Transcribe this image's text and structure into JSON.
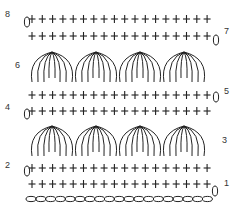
{
  "diagram": {
    "type": "crochet-chart",
    "stroke_color": "#222222",
    "stitches_per_row": 18,
    "foundation_chains": 19,
    "shells_per_row": 4,
    "row_labels": [
      {
        "row": "1",
        "side": "right"
      },
      {
        "row": "2",
        "side": "left"
      },
      {
        "row": "3",
        "side": "right"
      },
      {
        "row": "4",
        "side": "left"
      },
      {
        "row": "5",
        "side": "right"
      },
      {
        "row": "6",
        "side": "left"
      },
      {
        "row": "7",
        "side": "right"
      },
      {
        "row": "8",
        "side": "left"
      }
    ],
    "rows": [
      {
        "row": 1,
        "stitch": "single-crochet",
        "symbol": "+"
      },
      {
        "row": 2,
        "stitch": "single-crochet",
        "symbol": "+"
      },
      {
        "row": 3,
        "stitch": "shell",
        "symbol": "fan"
      },
      {
        "row": 4,
        "stitch": "single-crochet",
        "symbol": "+"
      },
      {
        "row": 5,
        "stitch": "single-crochet",
        "symbol": "+"
      },
      {
        "row": 6,
        "stitch": "shell",
        "symbol": "fan"
      },
      {
        "row": 7,
        "stitch": "single-crochet",
        "symbol": "+"
      },
      {
        "row": 8,
        "stitch": "single-crochet",
        "symbol": "+"
      }
    ]
  }
}
